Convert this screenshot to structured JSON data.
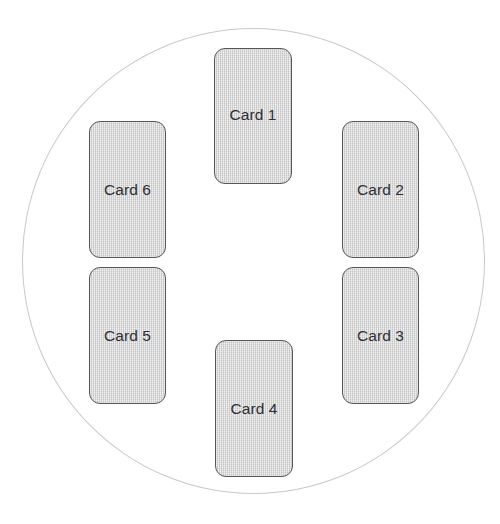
{
  "canvas": {
    "width": 500,
    "height": 524,
    "background_color": "#ffffff"
  },
  "diagram": {
    "name": "round-table-card-layout",
    "table": {
      "shape": "circle",
      "stroke_color": "#c9c9c9",
      "fill_color": "none",
      "center_x": 254,
      "center_y": 261,
      "diameter": 466
    },
    "card_style": {
      "fill_color": "#d4d4d4",
      "border_color": "#575757",
      "text_color": "#2f2f33",
      "corner_radius": 11,
      "width": 77,
      "height": 137
    },
    "cards": [
      {
        "id": "card-1",
        "label": "Card 1",
        "position": "top-center",
        "x": 214,
        "y": 48,
        "label_align": "upper"
      },
      {
        "id": "card-2",
        "label": "Card 2",
        "position": "right-upper",
        "x": 342,
        "y": 121,
        "label_align": "middle"
      },
      {
        "id": "card-3",
        "label": "Card 3",
        "position": "right-lower",
        "x": 342,
        "y": 267,
        "label_align": "middle"
      },
      {
        "id": "card-4",
        "label": "Card 4",
        "position": "bottom-center",
        "x": 215,
        "y": 340,
        "label_align": "lower"
      },
      {
        "id": "card-5",
        "label": "Card 5",
        "position": "left-lower",
        "x": 89,
        "y": 267,
        "label_align": "middle"
      },
      {
        "id": "card-6",
        "label": "Card 6",
        "position": "left-upper",
        "x": 89,
        "y": 121,
        "label_align": "middle"
      }
    ]
  }
}
